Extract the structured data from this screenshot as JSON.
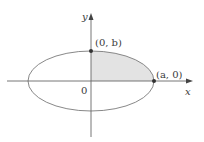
{
  "diagram": {
    "type": "ellipse-quadrant",
    "axes": {
      "x_label": "x",
      "y_label": "y",
      "origin_label": "0"
    },
    "points": [
      {
        "label": "(0, b)",
        "role": "y-intercept"
      },
      {
        "label": "(a, 0)",
        "role": "x-intercept"
      }
    ],
    "shaded_region": "first quadrant of ellipse",
    "colors": {
      "shade": "#e3e3e3",
      "stroke": "#7a7a7a",
      "axis": "#555555",
      "point": "#333333"
    }
  }
}
